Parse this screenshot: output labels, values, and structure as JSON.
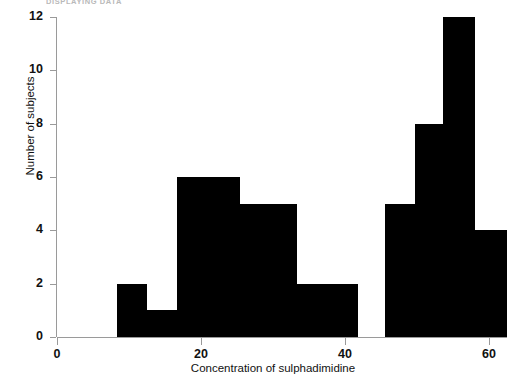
{
  "running_header": {
    "text": "DISPLAYING DATA"
  },
  "chart_data": {
    "type": "bar",
    "title": "",
    "subtitle": "",
    "xlabel": "Concentration of sulphadimidine",
    "ylabel": "Number of subjects",
    "xlim": [
      0,
      62.5
    ],
    "ylim": [
      0,
      12
    ],
    "grid": false,
    "legend": null,
    "xticks": [
      0,
      20,
      40,
      60
    ],
    "xtick_labels": [
      "0",
      "20",
      "40",
      "60"
    ],
    "yticks": [
      0,
      2,
      4,
      6,
      8,
      10,
      12
    ],
    "ytick_labels": [
      "0",
      "2",
      "4",
      "6",
      "8",
      "10",
      "12"
    ],
    "bar_color": "#000000",
    "axis_color": "#9a9a9a",
    "bins": [
      {
        "x0": 8.3,
        "x1": 12.5,
        "value": 2
      },
      {
        "x0": 12.5,
        "x1": 16.7,
        "value": 1
      },
      {
        "x0": 16.7,
        "x1": 25.4,
        "value": 6
      },
      {
        "x0": 25.4,
        "x1": 33.3,
        "value": 5
      },
      {
        "x0": 33.3,
        "x1": 41.8,
        "value": 2
      },
      {
        "x0": 45.6,
        "x1": 49.7,
        "value": 5
      },
      {
        "x0": 49.7,
        "x1": 53.6,
        "value": 8
      },
      {
        "x0": 53.6,
        "x1": 58.0,
        "value": 12
      },
      {
        "x0": 58.0,
        "x1": 62.5,
        "value": 4
      }
    ],
    "categories": [
      "8.3-12.5",
      "12.5-16.7",
      "16.7-25.4",
      "25.4-33.3",
      "33.3-41.8",
      "45.6-49.7",
      "49.7-53.6",
      "53.6-58.0",
      "58.0-62.5"
    ],
    "values": [
      2,
      1,
      6,
      5,
      2,
      5,
      8,
      12,
      4
    ]
  }
}
